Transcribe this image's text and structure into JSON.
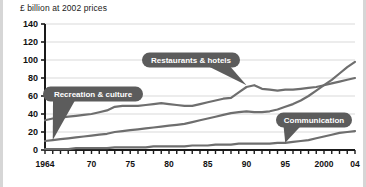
{
  "chart_data": {
    "type": "line",
    "title": "£ billion at 2002 prices",
    "xlabel": "",
    "ylabel": "",
    "ylim": [
      0,
      140
    ],
    "xlim": [
      1964,
      2004
    ],
    "yticks": [
      0,
      20,
      40,
      60,
      80,
      100,
      120,
      140
    ],
    "ytick_labels": [
      "0",
      "20",
      "40",
      "60",
      "80",
      "100",
      "120",
      "140"
    ],
    "xticks": [
      1964,
      1970,
      1975,
      1980,
      1985,
      1990,
      1995,
      2000,
      2004
    ],
    "xtick_labels": [
      "1964",
      "70",
      "75",
      "80",
      "85",
      "90",
      "95",
      "2000",
      "04"
    ],
    "grid": true,
    "grid_axis": "y",
    "legend": "callout-labels",
    "minor_tick_interval": 1,
    "line_color": "#6e6e6e",
    "grid_color": "#cfcfcf",
    "axis_color": "#1a1a1a",
    "callout_fill": "#5c5c5c",
    "callout_text_color": "#ffffff",
    "x": [
      1964,
      1965,
      1966,
      1967,
      1968,
      1969,
      1970,
      1971,
      1972,
      1973,
      1974,
      1975,
      1976,
      1977,
      1978,
      1979,
      1980,
      1981,
      1982,
      1983,
      1984,
      1985,
      1986,
      1987,
      1988,
      1989,
      1990,
      1991,
      1992,
      1993,
      1994,
      1995,
      1996,
      1997,
      1998,
      1999,
      2000,
      2001,
      2002,
      2003,
      2004
    ],
    "series": [
      {
        "name": "Restaurants & hotels",
        "label": "Restaurants & hotels",
        "values": [
          33,
          35,
          36,
          37,
          38,
          39,
          40,
          42,
          44,
          48,
          49,
          49,
          49,
          50,
          51,
          52,
          51,
          50,
          49,
          49,
          51,
          53,
          55,
          57,
          58,
          64,
          70,
          72,
          68,
          67,
          66,
          67,
          67,
          68,
          69,
          70,
          72,
          74,
          76,
          78,
          80
        ]
      },
      {
        "name": "Recreation & culture",
        "label": "Recreation & culture",
        "values": [
          10,
          11,
          12,
          13,
          14,
          15,
          16,
          17,
          18,
          20,
          21,
          22,
          23,
          24,
          25,
          26,
          27,
          28,
          29,
          31,
          33,
          35,
          37,
          39,
          41,
          42,
          43,
          42,
          42,
          43,
          45,
          48,
          51,
          55,
          60,
          66,
          72,
          78,
          85,
          92,
          98
        ]
      },
      {
        "name": "Communication",
        "label": "Communication",
        "values": [
          1,
          1,
          1,
          1,
          2,
          2,
          2,
          2,
          2,
          3,
          3,
          3,
          3,
          3,
          4,
          4,
          4,
          4,
          4,
          5,
          5,
          5,
          6,
          6,
          6,
          7,
          7,
          7,
          7,
          7,
          8,
          8,
          9,
          10,
          11,
          13,
          15,
          17,
          19,
          20,
          21
        ]
      }
    ],
    "annotations": [
      {
        "text": "Restaurants & hotels",
        "points_to_year": 1990,
        "points_to_value": 72
      },
      {
        "text": "Recreation & culture",
        "points_to_year": 1965,
        "points_to_value": 11
      },
      {
        "text": "Communication",
        "points_to_year": 1995,
        "points_to_value": 8
      }
    ]
  }
}
